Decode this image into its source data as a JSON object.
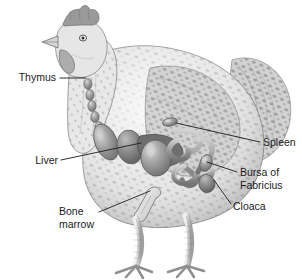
{
  "figure": {
    "view": "left lateral",
    "background_color": "#ffffff",
    "line_color": "#1a1a1a",
    "text_color": "#1a1a1a",
    "style": "grayscale pencil/airbrush scientific illustration"
  },
  "labels": [
    {
      "id": "thymus",
      "text": "Thymus",
      "lines": [
        "Thymus"
      ],
      "anchor": "end",
      "text_x": 56,
      "text_y": 78,
      "leader": "M60,78 L86,78",
      "points_to": "neck chain of thymus lobes"
    },
    {
      "id": "liver",
      "text": "Liver",
      "lines": [
        "Liver"
      ],
      "anchor": "end",
      "text_x": 58,
      "text_y": 161,
      "leader": "M61,160 L141,143",
      "points_to": "large lobed liver in mid-body"
    },
    {
      "id": "bone-marrow",
      "text": "Bone marrow",
      "lines": [
        "Bone",
        "marrow"
      ],
      "anchor": "start",
      "text_x": 59,
      "text_y": 212,
      "leader": "M99,212 L150,191",
      "points_to": "femur / leg bone"
    },
    {
      "id": "spleen",
      "text": "Spleen",
      "lines": [
        "Spleen"
      ],
      "anchor": "start",
      "text_x": 263,
      "text_y": 143,
      "leader": "M176,123 L260,142",
      "points_to": "small oval spleen above intestine"
    },
    {
      "id": "bursa-of-fabricius",
      "text": "Bursa of Fabricius",
      "lines": [
        "Bursa of",
        "Fabricius"
      ],
      "anchor": "start",
      "text_x": 240,
      "text_y": 173,
      "leader": "M207,162 L237,172",
      "points_to": "bursa sac near cloaca"
    },
    {
      "id": "cloaca",
      "text": "Cloaca",
      "lines": [
        "Cloaca"
      ],
      "anchor": "start",
      "text_x": 233,
      "text_y": 207,
      "leader": "M214,180 L231,204",
      "points_to": "cloacal vent at rear"
    }
  ],
  "organs": [
    {
      "id": "thymus-lobes",
      "name": "Thymus",
      "description": "chain of small rounded lobes along the neck"
    },
    {
      "id": "liver-lobes",
      "name": "Liver",
      "description": "three large smooth ellipsoid lobes in mid-body"
    },
    {
      "id": "spleen-body",
      "name": "Spleen",
      "description": "small oval organ above the intestinal coil"
    },
    {
      "id": "intestine-coil",
      "name": "Intestine",
      "description": "coiled tubular intestines in abdomen"
    },
    {
      "id": "bursa-sac",
      "name": "Bursa of Fabricius",
      "description": "small pouch dorsal to the cloaca"
    },
    {
      "id": "cloaca-vent",
      "name": "Cloaca",
      "description": "terminal vent opening at rear"
    },
    {
      "id": "femur-bone",
      "name": "Bone marrow",
      "description": "leg bone shown within the thigh"
    }
  ],
  "anatomy_parts": [
    {
      "id": "comb",
      "name": "comb"
    },
    {
      "id": "eye",
      "name": "eye"
    },
    {
      "id": "beak",
      "name": "beak"
    },
    {
      "id": "wattle",
      "name": "wattle"
    },
    {
      "id": "body",
      "name": "body with speckled plumage"
    },
    {
      "id": "wing",
      "name": "wing"
    },
    {
      "id": "tail",
      "name": "tail feathers"
    },
    {
      "id": "legs",
      "name": "scaled legs"
    },
    {
      "id": "feet",
      "name": "clawed feet"
    }
  ]
}
